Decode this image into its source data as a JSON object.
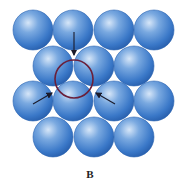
{
  "figure": {
    "label": "B",
    "sphere_radius": 20,
    "sphere_color": "#3f7fcf",
    "sphere_highlight": "#cfe2f7",
    "sphere_shadow": "#1f5aa8",
    "rows": [
      {
        "y": 30,
        "x": [
          33,
          73,
          114,
          154
        ]
      },
      {
        "y": 66,
        "x": [
          53,
          94,
          134
        ]
      },
      {
        "y": 101,
        "x": [
          33,
          73,
          114,
          154
        ]
      },
      {
        "y": 137,
        "x": [
          53,
          94,
          134
        ]
      }
    ],
    "highlight_circle": {
      "cx": 74,
      "cy": 79,
      "r": 19,
      "color": "#6a1f3a"
    },
    "arrows": [
      {
        "name": "arrow-top",
        "x1": 74,
        "y1": 32,
        "x2": 74,
        "y2": 55
      },
      {
        "name": "arrow-left",
        "x1": 33,
        "y1": 104,
        "x2": 52,
        "y2": 93
      },
      {
        "name": "arrow-right",
        "x1": 115,
        "y1": 104,
        "x2": 96,
        "y2": 93
      }
    ],
    "arrow_color": "#1a1a2a"
  }
}
